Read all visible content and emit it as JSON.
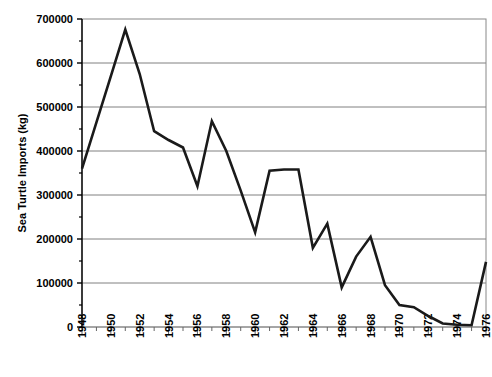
{
  "chart_data": {
    "type": "line",
    "title": "",
    "xlabel": "",
    "ylabel": "Sea Turtle Imports (kg)",
    "xlim": [
      1948,
      1976
    ],
    "ylim": [
      0,
      700000
    ],
    "grid": true,
    "legend": false,
    "legend_position": "none",
    "line_color": "#1a1a1a",
    "grid_color": "#808080",
    "axis_color": "#000000",
    "y_ticks": [
      0,
      100000,
      200000,
      300000,
      400000,
      500000,
      600000,
      700000
    ],
    "y_tick_labels": [
      "0",
      "100000",
      "200000",
      "300000",
      "400000",
      "500000",
      "600000",
      "700000"
    ],
    "x_ticks": [
      1948,
      1950,
      1952,
      1954,
      1956,
      1958,
      1960,
      1962,
      1964,
      1966,
      1968,
      1970,
      1972,
      1974,
      1976
    ],
    "x_tick_labels": [
      "1948",
      "1950",
      "1952",
      "1954",
      "1956",
      "1958",
      "1960",
      "1962",
      "1964",
      "1966",
      "1968",
      "1970",
      "1972",
      "1974",
      "1976"
    ],
    "x_minor_ticks": [
      1949,
      1951,
      1953,
      1955,
      1957,
      1959,
      1961,
      1963,
      1965,
      1967,
      1969,
      1971,
      1973,
      1975
    ],
    "x": [
      1948,
      1949,
      1950,
      1951,
      1952,
      1953,
      1954,
      1955,
      1956,
      1957,
      1958,
      1959,
      1960,
      1961,
      1962,
      1963,
      1964,
      1965,
      1966,
      1967,
      1968,
      1969,
      1970,
      1971,
      1972,
      1973,
      1974,
      1975,
      1976
    ],
    "values": [
      360000,
      465000,
      570000,
      676000,
      575000,
      445000,
      425000,
      408000,
      320000,
      468000,
      400000,
      310000,
      215000,
      355000,
      358000,
      358000,
      180000,
      235000,
      90000,
      160000,
      205000,
      95000,
      50000,
      45000,
      25000,
      8000,
      5000,
      4000,
      148000
    ],
    "series": [
      {
        "name": "Sea Turtle Imports",
        "values": [
          360000,
          465000,
          570000,
          676000,
          575000,
          445000,
          425000,
          408000,
          320000,
          468000,
          400000,
          310000,
          215000,
          355000,
          358000,
          358000,
          180000,
          235000,
          90000,
          160000,
          205000,
          95000,
          50000,
          45000,
          25000,
          8000,
          5000,
          4000,
          148000
        ]
      }
    ]
  }
}
